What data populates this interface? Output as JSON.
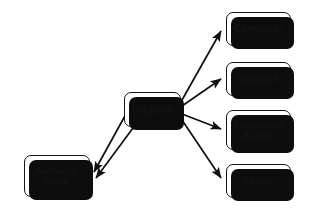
{
  "diagram": {
    "type": "node-link-diagram",
    "background_color": "#ffffff",
    "node_fill_color": "#ffffff",
    "node_border_color": "#141414",
    "node_shadow_color": "#0d0d0d",
    "edge_color": "#101010",
    "nodes": [
      {
        "id": "location",
        "label": "Location",
        "x": 124,
        "y": 92,
        "w": 57,
        "h": 35
      },
      {
        "id": "computer",
        "label": "Computer",
        "x": 226,
        "y": 12,
        "w": 65,
        "h": 34
      },
      {
        "id": "network",
        "label": "Network",
        "x": 226,
        "y": 62,
        "w": 65,
        "h": 34
      },
      {
        "id": "peripheral",
        "label": "Peripheral\ndevice",
        "x": 226,
        "y": 110,
        "w": 65,
        "h": 40
      },
      {
        "id": "server",
        "label": "Server",
        "x": 226,
        "y": 164,
        "w": 65,
        "h": 34
      },
      {
        "id": "network-node",
        "label": "Network\nnode",
        "x": 24,
        "y": 155,
        "w": 66,
        "h": 42
      }
    ],
    "edges": [
      {
        "id": "location-to-computer",
        "from": "location",
        "to": "computer",
        "arrow": "single"
      },
      {
        "id": "location-to-network",
        "from": "location",
        "to": "network",
        "arrow": "single"
      },
      {
        "id": "location-to-peripheral",
        "from": "location",
        "to": "peripheral",
        "arrow": "single"
      },
      {
        "id": "location-to-server",
        "from": "location",
        "to": "server",
        "arrow": "single"
      },
      {
        "id": "location-to-network-node-a",
        "from": "location",
        "to": "network-node",
        "arrow": "single"
      },
      {
        "id": "location-to-network-node-b",
        "from": "location",
        "to": "network-node",
        "arrow": "single"
      }
    ]
  }
}
